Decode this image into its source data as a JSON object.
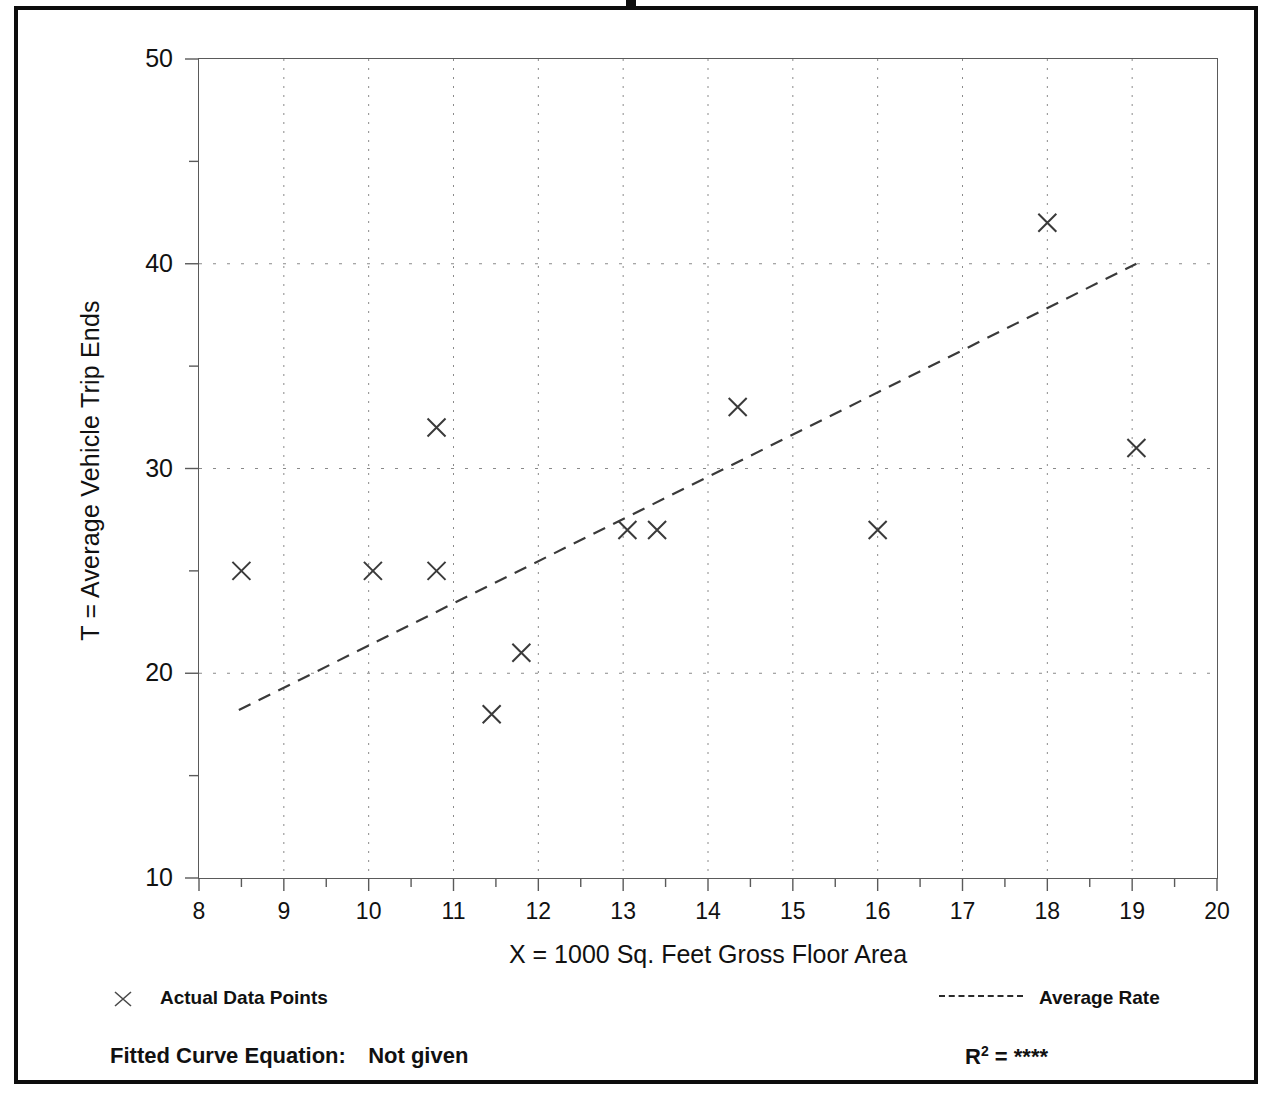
{
  "chart_data": {
    "type": "scatter",
    "title": "",
    "xlabel": "X = 1000 Sq. Feet Gross Floor Area",
    "ylabel": "T = Average Vehicle Trip Ends",
    "xlim": [
      8,
      20
    ],
    "ylim": [
      10,
      50
    ],
    "xticks": [
      8,
      9,
      10,
      11,
      12,
      13,
      14,
      15,
      16,
      17,
      18,
      19,
      20
    ],
    "yticks": [
      10,
      20,
      30,
      40,
      50
    ],
    "yminorticks": [
      15,
      25,
      35,
      45
    ],
    "grid": "dotted-vertical-at-every-integer-and-dotted-horizontal-at-major-y",
    "series": [
      {
        "name": "Actual Data Points",
        "marker": "x",
        "points": [
          {
            "x": 8.5,
            "y": 25
          },
          {
            "x": 10.05,
            "y": 25
          },
          {
            "x": 10.8,
            "y": 25
          },
          {
            "x": 10.8,
            "y": 32
          },
          {
            "x": 11.45,
            "y": 18
          },
          {
            "x": 11.8,
            "y": 21
          },
          {
            "x": 13.05,
            "y": 27
          },
          {
            "x": 13.4,
            "y": 27
          },
          {
            "x": 14.35,
            "y": 33
          },
          {
            "x": 16.0,
            "y": 27
          },
          {
            "x": 18.0,
            "y": 42
          },
          {
            "x": 19.05,
            "y": 31
          }
        ]
      },
      {
        "name": "Average Rate",
        "style": "dashed-line",
        "points": [
          {
            "x": 8.47,
            "y": 18.2
          },
          {
            "x": 19.05,
            "y": 40.0
          }
        ]
      }
    ]
  },
  "legend": {
    "data_points_label": "Actual Data Points",
    "average_rate_label": "Average Rate",
    "marker_icon": "x-marker-icon",
    "line_icon": "dashed-line-icon"
  },
  "footer": {
    "fitted_curve_label": "Fitted Curve Equation:",
    "fitted_curve_value": "Not given",
    "r2_symbol": "R",
    "r2_exponent": "2",
    "r2_equals": "=",
    "r2_value": "****"
  },
  "colors": {
    "frame": "#0d0d0d",
    "axis": "#5a5a5a",
    "grid": "#8a8a8a",
    "marker": "#3a3a3a",
    "trend": "#3a3a3a",
    "text": "#111111"
  }
}
